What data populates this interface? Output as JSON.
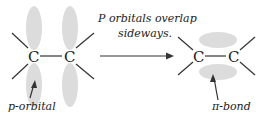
{
  "diagram": {
    "left_molecule": {
      "atoms": [
        "C",
        "C"
      ],
      "label": "p-orbital"
    },
    "arrow_caption": [
      "P orbitals overlap",
      "sideways."
    ],
    "right_molecule": {
      "atoms": [
        "C",
        "C"
      ],
      "label": "π-bond"
    },
    "colors": {
      "orbital": "#dcdcdc",
      "line": "#333333",
      "text": "#222222"
    }
  }
}
